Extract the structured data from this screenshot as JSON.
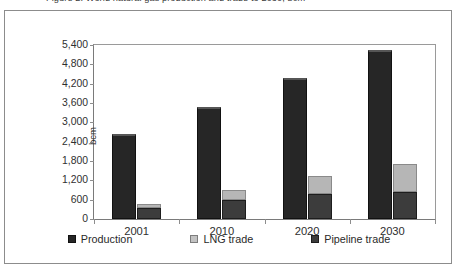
{
  "caption": {
    "text": "Figure 2. World natural gas production and trade to 2030, bcm"
  },
  "chart_data": {
    "type": "bar",
    "subtype": "grouped-stacked",
    "title": "",
    "xlabel": "",
    "ylabel": "bcm",
    "categories": [
      "2001",
      "2010",
      "2020",
      "2030"
    ],
    "ylim": [
      0,
      5400
    ],
    "yticks": [
      0,
      600,
      1200,
      1800,
      2400,
      3000,
      3600,
      4200,
      4800,
      5400
    ],
    "ytick_labels": [
      "0",
      "600",
      "1,200",
      "1,800",
      "2,400",
      "3,000",
      "3,600",
      "4,200",
      "4,800",
      "5,400"
    ],
    "grid": false,
    "legend_position": "bottom",
    "series": [
      {
        "name": "Production",
        "color": "#262626",
        "stack": "production",
        "values": [
          2640,
          3480,
          4380,
          5250
        ]
      },
      {
        "name": "Pipeline trade",
        "color": "#3c3c3c",
        "stack": "trade",
        "values": [
          330,
          590,
          780,
          840
        ]
      },
      {
        "name": "LNG trade",
        "color": "#b6b6b6",
        "stack": "trade",
        "values": [
          150,
          310,
          540,
          860
        ]
      }
    ],
    "legend": [
      "Production",
      "LNG trade",
      "Pipeline trade"
    ]
  }
}
